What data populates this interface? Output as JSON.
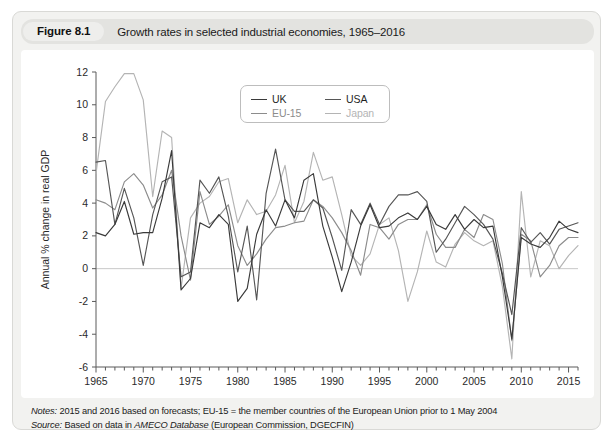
{
  "figure": {
    "number_label": "Figure 8.1",
    "caption": "Growth rates in selected industrial economies, 1965–2016"
  },
  "notes": {
    "notes_key": "Notes:",
    "notes_text": " 2015 and 2016 based on forecasts; EU-15 = the member countries of the European Union prior to 1 May 2004",
    "source_key": "Source:",
    "source_text_pre": " Based on data in ",
    "source_em": "AMECO Database",
    "source_text_post": " (European Commission, DGECFIN)"
  },
  "legend": {
    "entries": [
      {
        "label": "UK",
        "color": "#3a3a3a"
      },
      {
        "label": "USA",
        "color": "#565656"
      },
      {
        "label": "EU-15",
        "color": "#8c8c8c"
      },
      {
        "label": "Japan",
        "color": "#b4b4b4"
      }
    ]
  },
  "chart_data": {
    "type": "line",
    "title": "Growth rates in selected industrial economies, 1965–2016",
    "xlabel": "",
    "ylabel": "Annual % change in real GDP",
    "xlim": [
      1965,
      2016
    ],
    "ylim": [
      -6,
      12
    ],
    "yticks": [
      -6,
      -4,
      -2,
      0,
      2,
      4,
      6,
      8,
      10,
      12
    ],
    "ytick_labels": [
      "-6",
      "-4",
      "-2",
      "0",
      "2",
      "4",
      "6",
      "8",
      "10",
      "12"
    ],
    "xticks": [
      1965,
      1970,
      1975,
      1980,
      1985,
      1990,
      1995,
      2000,
      2005,
      2010,
      2015
    ],
    "xtick_labels": [
      "1965",
      "1970",
      "1975",
      "1980",
      "1985",
      "1990",
      "1995",
      "2000",
      "2005",
      "2010",
      "2015"
    ],
    "xtick_minor_step": 1,
    "grid": false,
    "zero_line": true,
    "legend_position": "top-center",
    "x": [
      1965,
      1966,
      1967,
      1968,
      1969,
      1970,
      1971,
      1972,
      1973,
      1974,
      1975,
      1976,
      1977,
      1978,
      1979,
      1980,
      1981,
      1982,
      1983,
      1984,
      1985,
      1986,
      1987,
      1988,
      1989,
      1990,
      1991,
      1992,
      1993,
      1994,
      1995,
      1996,
      1997,
      1998,
      1999,
      2000,
      2001,
      2002,
      2003,
      2004,
      2005,
      2006,
      2007,
      2008,
      2009,
      2010,
      2011,
      2012,
      2013,
      2014,
      2015,
      2016
    ],
    "series": [
      {
        "name": "UK",
        "color": "#3a3a3a",
        "values": [
          2.2,
          2.0,
          2.7,
          4.1,
          2.1,
          2.2,
          2.2,
          4.3,
          7.2,
          -1.3,
          -0.6,
          2.8,
          2.5,
          3.3,
          2.7,
          -2.0,
          -1.2,
          2.1,
          3.6,
          2.6,
          4.2,
          3.1,
          5.4,
          5.8,
          2.6,
          0.7,
          -1.4,
          0.4,
          2.6,
          3.9,
          2.5,
          2.6,
          3.1,
          3.4,
          3.0,
          3.8,
          2.7,
          2.4,
          3.3,
          2.4,
          3.0,
          2.5,
          2.6,
          -0.5,
          -4.3,
          1.9,
          1.5,
          1.3,
          1.9,
          2.9,
          2.4,
          2.2
        ]
      },
      {
        "name": "USA",
        "color": "#565656",
        "values": [
          6.5,
          6.6,
          2.7,
          4.9,
          3.1,
          0.2,
          3.3,
          5.3,
          5.6,
          -0.5,
          -0.2,
          5.4,
          4.6,
          5.6,
          3.2,
          -0.2,
          2.6,
          -1.9,
          4.6,
          7.3,
          4.2,
          3.5,
          3.5,
          4.2,
          3.7,
          1.9,
          -0.1,
          3.6,
          2.7,
          4.0,
          2.7,
          3.8,
          4.5,
          4.5,
          4.7,
          4.1,
          1.0,
          1.8,
          2.8,
          3.8,
          3.3,
          2.7,
          1.8,
          -0.3,
          -2.8,
          2.5,
          1.6,
          2.2,
          1.5,
          2.4,
          2.6,
          2.8
        ]
      },
      {
        "name": "EU-15",
        "color": "#8c8c8c",
        "values": [
          4.2,
          4.0,
          3.6,
          5.3,
          5.8,
          5.1,
          3.7,
          4.5,
          6.0,
          2.0,
          -0.7,
          4.7,
          2.7,
          3.2,
          3.9,
          1.4,
          0.2,
          0.9,
          1.8,
          2.5,
          2.6,
          2.8,
          2.9,
          4.2,
          3.8,
          3.1,
          2.2,
          1.1,
          -0.4,
          2.7,
          2.5,
          1.8,
          2.7,
          3.0,
          3.0,
          3.9,
          2.1,
          1.3,
          1.3,
          2.4,
          1.9,
          3.3,
          3.0,
          0.3,
          -4.4,
          2.1,
          1.7,
          -0.5,
          0.2,
          1.4,
          1.9,
          1.9
        ]
      },
      {
        "name": "Japan",
        "color": "#b4b4b4",
        "values": [
          5.8,
          10.2,
          11.1,
          11.9,
          11.9,
          10.3,
          4.4,
          8.4,
          8.0,
          -1.2,
          3.1,
          4.0,
          4.4,
          5.3,
          5.5,
          2.8,
          4.2,
          3.3,
          3.5,
          4.5,
          6.3,
          2.8,
          4.1,
          7.1,
          5.4,
          5.6,
          3.3,
          0.8,
          0.2,
          0.9,
          2.7,
          3.1,
          1.1,
          -2.0,
          -0.2,
          2.3,
          0.4,
          0.1,
          1.5,
          2.2,
          1.7,
          1.4,
          1.7,
          -1.1,
          -5.5,
          4.7,
          -0.5,
          1.7,
          1.4,
          0.0,
          0.8,
          1.4
        ]
      }
    ]
  }
}
